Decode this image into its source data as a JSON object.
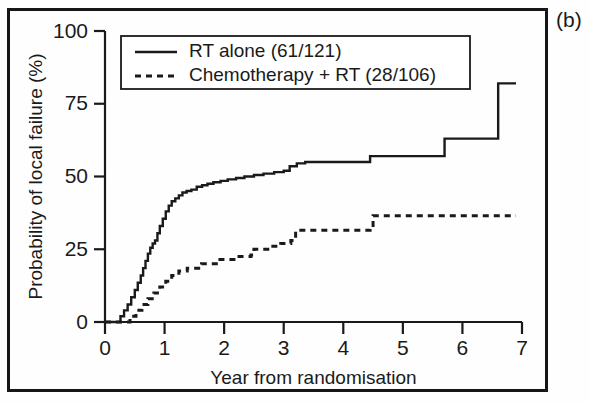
{
  "panel": {
    "label": "(b)"
  },
  "chart_data": {
    "type": "line",
    "subtype": "kaplan-meier-step",
    "title": "",
    "xlabel": "Year from randomisation",
    "ylabel": "Probability of local failure (%)",
    "xlim": [
      0,
      7
    ],
    "ylim": [
      0,
      100
    ],
    "xticks": [
      "0",
      "1",
      "2",
      "3",
      "4",
      "5",
      "6",
      "7"
    ],
    "yticks": [
      "0",
      "25",
      "50",
      "75",
      "100"
    ],
    "grid": false,
    "legend_position": "top-left-inside",
    "series": [
      {
        "name": "RT alone (61/121)",
        "events": "61",
        "total": "121",
        "style": "solid",
        "color": "#1a1a1a",
        "x": [
          0,
          0.18,
          0.26,
          0.32,
          0.38,
          0.44,
          0.5,
          0.55,
          0.6,
          0.64,
          0.68,
          0.72,
          0.76,
          0.8,
          0.84,
          0.88,
          0.92,
          0.97,
          1.02,
          1.07,
          1.12,
          1.18,
          1.24,
          1.3,
          1.37,
          1.45,
          1.54,
          1.63,
          1.72,
          1.82,
          1.94,
          2.06,
          2.2,
          2.34,
          2.5,
          2.66,
          2.84,
          3.0,
          3.1,
          3.22,
          3.36,
          4.45,
          5.7,
          6.6,
          6.9
        ],
        "y": [
          0,
          0,
          2.0,
          4.0,
          6.0,
          8.5,
          11.0,
          13.5,
          16.0,
          18.5,
          21.0,
          23.5,
          25.5,
          27.0,
          28.0,
          30.5,
          33.0,
          35.5,
          38.0,
          40.0,
          41.5,
          42.5,
          43.5,
          44.5,
          45.0,
          45.5,
          46.5,
          47.0,
          47.5,
          48.0,
          48.5,
          49.0,
          49.5,
          50.0,
          50.5,
          51.0,
          51.5,
          52.0,
          53.5,
          54.5,
          55.0,
          57.0,
          63.0,
          82.0,
          82.0
        ]
      },
      {
        "name": "Chemotherapy + RT (28/106)",
        "events": "28",
        "total": "106",
        "style": "dashed",
        "color": "#1a1a1a",
        "x": [
          0,
          0.3,
          0.42,
          0.52,
          0.62,
          0.72,
          0.82,
          0.92,
          1.02,
          1.12,
          1.24,
          1.38,
          1.6,
          1.62,
          1.9,
          2.2,
          2.45,
          2.5,
          2.78,
          2.95,
          3.12,
          3.2,
          4.45,
          4.5,
          6.9
        ],
        "y": [
          0,
          0,
          2.0,
          4.0,
          6.0,
          8.0,
          10.0,
          12.0,
          14.0,
          16.0,
          17.5,
          18.5,
          19.0,
          20.0,
          21.5,
          22.5,
          23.0,
          25.0,
          26.0,
          27.0,
          28.0,
          31.5,
          32.0,
          36.5,
          36.5
        ]
      }
    ]
  }
}
